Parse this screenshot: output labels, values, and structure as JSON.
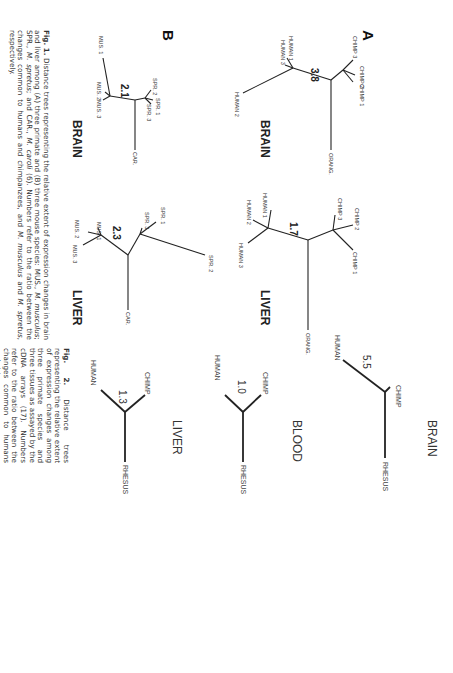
{
  "figure1": {
    "panels": [
      {
        "letter": "A"
      },
      {
        "letter": "B"
      }
    ],
    "trees": {
      "a_brain": {
        "tissue": "BRAIN",
        "ratio": "3.8",
        "leaves": [
          "CHIMP 3",
          "CHIMP 2",
          "CHIMP 1",
          "HUMAN 1",
          "HUMAN 3",
          "HUMAN 2",
          "ORANG."
        ]
      },
      "a_liver": {
        "tissue": "LIVER",
        "ratio": "1.7",
        "leaves": [
          "CHIMP 3",
          "CHIMP 2",
          "CHIMP 1",
          "HUMAN 1",
          "HUMAN 2",
          "HUMAN 3",
          "ORANG."
        ]
      },
      "b_brain": {
        "tissue": "BRAIN",
        "ratio": "2.1",
        "leaves": [
          "SPR. 2",
          "SPR. 1",
          "SPR. 3",
          "MUS. 1",
          "MUS. 2",
          "MUS. 3",
          "CAR."
        ]
      },
      "b_liver": {
        "tissue": "LIVER",
        "ratio": "2.3",
        "leaves": [
          "SPR. 1",
          "SPR. 3",
          "SPR. 2",
          "MUS. 1",
          "MUS. 2",
          "MUS. 3",
          "CAR."
        ]
      }
    },
    "caption": {
      "label": "Fig. 1.",
      "text_1": " Distance trees representing the relative extent of expression changes in brain and liver among (A) three primate and (B) three mouse species: MUS., ",
      "it_1": "M. musculus",
      "text_2": "; SPR., ",
      "it_2": "M. spretus",
      "text_3": "; and CAR., ",
      "it_3": "M. caroli",
      "text_4": " (6). Numbers refer to the ratio between the changes common to humans and chimpanzees, and ",
      "it_4": "M. musculus",
      "text_5": " and ",
      "it_5": "M. spretus",
      "text_6": ", respectively."
    }
  },
  "figure2": {
    "trees": [
      {
        "tissue": "BRAIN",
        "ratio": "5.5",
        "leaves": [
          "HUMAN",
          "CHIMP",
          "RHESUS"
        ]
      },
      {
        "tissue": "BLOOD",
        "ratio": "1.0",
        "leaves": [
          "HUMAN",
          "CHIMP",
          "RHESUS"
        ]
      },
      {
        "tissue": "LIVER",
        "ratio": "1.3",
        "leaves": [
          "HUMAN",
          "CHIMP",
          "RHESUS"
        ]
      }
    ],
    "caption": {
      "label": "Fig. 2.",
      "text": " Distance trees representing the relative extent of expression changes among three primate species and three tissues as assayed by the cDNA arrays (17). Numbers refer to the ratio between the changes common to humans and chimpanzees."
    }
  }
}
